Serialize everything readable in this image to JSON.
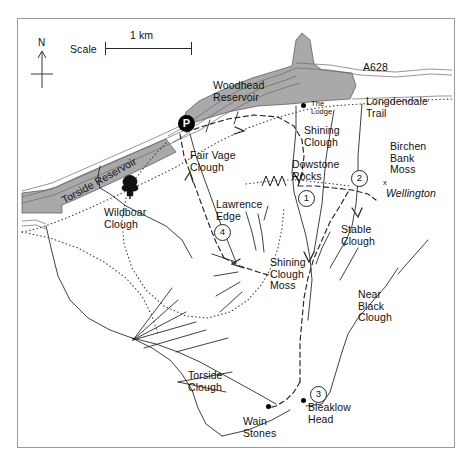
{
  "map": {
    "title": "Bleaklow and Longdendale walking map",
    "frame": {
      "x": 17,
      "y": 18,
      "w": 438,
      "h": 430,
      "border_color": "#9a9a9a"
    },
    "background_color": "#ffffff",
    "water_fill": "#a9a9a9",
    "scale": {
      "label": "Scale",
      "distance_label": "1 km",
      "bar_px": 87,
      "x": 105,
      "y": 42
    },
    "north_arrow": {
      "label": "N",
      "x": 42,
      "y": 44
    }
  },
  "labels": [
    {
      "name": "woodhead-reservoir",
      "text": "Woodhead\nReservoir",
      "x": 213,
      "y": 80,
      "size": "normal"
    },
    {
      "name": "torside-reservoir",
      "text": "Torside Reservoir",
      "x": 60,
      "y": 196,
      "size": "normal",
      "rotate": -29
    },
    {
      "name": "a628-road",
      "text": "A628",
      "x": 363,
      "y": 62,
      "size": "normal"
    },
    {
      "name": "longdendale-trail",
      "text": "Longdendale\nTrail",
      "x": 366,
      "y": 96,
      "size": "normal"
    },
    {
      "name": "the-lodge",
      "text": "The\nLodge",
      "x": 311,
      "y": 109,
      "size": "small"
    },
    {
      "name": "shining-clough",
      "text": "Shining\nClough",
      "x": 304,
      "y": 131,
      "size": "normal"
    },
    {
      "name": "dowstone-rocks",
      "text": "Dowstone\nRocks",
      "x": 292,
      "y": 165,
      "size": "normal"
    },
    {
      "name": "birchen-bank-moss",
      "text": "Birchen\nBank\nMoss",
      "x": 390,
      "y": 147,
      "size": "normal"
    },
    {
      "name": "wellington-crash",
      "text": "Wellington",
      "x": 387,
      "y": 192,
      "size": "normal",
      "italic": true
    },
    {
      "name": "fair-vage-clough",
      "text": "Fair Vage\nClough",
      "x": 190,
      "y": 155,
      "size": "normal"
    },
    {
      "name": "lawrence-edge",
      "text": "Lawrence\nEdge",
      "x": 218,
      "y": 203,
      "size": "normal"
    },
    {
      "name": "wildboar-clough",
      "text": "Wildboar\nClough",
      "x": 104,
      "y": 207,
      "size": "normal"
    },
    {
      "name": "stable-clough",
      "text": "Stable\nClough",
      "x": 341,
      "y": 228,
      "size": "normal"
    },
    {
      "name": "shining-clough-moss",
      "text": "Shining\nClough\nMoss",
      "x": 272,
      "y": 261,
      "size": "normal"
    },
    {
      "name": "near-black-clough",
      "text": "Near\nBlack\nClough",
      "x": 360,
      "y": 293,
      "size": "normal"
    },
    {
      "name": "torside-clough",
      "text": "Torside\nClough",
      "x": 188,
      "y": 370,
      "size": "normal"
    },
    {
      "name": "bleaklow-head",
      "text": "Bleaklow\nHead",
      "x": 308,
      "y": 405,
      "size": "normal"
    },
    {
      "name": "wain-stones",
      "text": "Wain\nStones",
      "x": 243,
      "y": 418,
      "size": "normal"
    }
  ],
  "numbered_markers": [
    {
      "name": "marker-1",
      "label": "1",
      "x": 298,
      "y": 190
    },
    {
      "name": "marker-2",
      "label": "2",
      "x": 351,
      "y": 170
    },
    {
      "name": "marker-3",
      "label": "3",
      "x": 310,
      "y": 386
    },
    {
      "name": "marker-4",
      "label": "4",
      "x": 214,
      "y": 224
    }
  ],
  "point_symbols": [
    {
      "name": "parking-marker",
      "label": "P",
      "x": 186,
      "y": 123,
      "type": "parking"
    },
    {
      "name": "the-lodge-dot",
      "label": "",
      "x": 303,
      "y": 105,
      "type": "dot"
    },
    {
      "name": "wain-stones-dot",
      "label": "",
      "x": 268,
      "y": 406,
      "type": "dot"
    },
    {
      "name": "bleaklow-head-dot",
      "label": "",
      "x": 303,
      "y": 400,
      "type": "dot"
    },
    {
      "name": "wellington-cross",
      "label": "x",
      "x": 385,
      "y": 183,
      "type": "cross"
    },
    {
      "name": "tree-symbol",
      "label": "",
      "x": 130,
      "y": 184,
      "type": "tree"
    }
  ],
  "legend_note": {
    "dashed_meaning": "Pennine Way / main route",
    "dotted_meaning": "other footpaths",
    "double_line_meaning": "road / track",
    "shaded_meaning": "reservoir water"
  }
}
